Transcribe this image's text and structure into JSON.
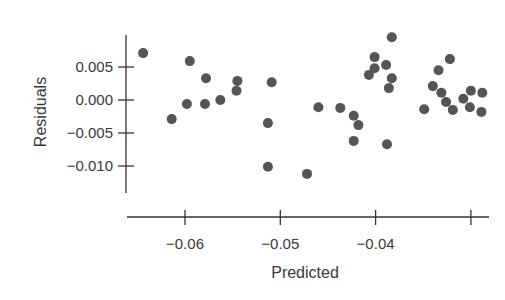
{
  "chart_data": {
    "type": "scatter",
    "title": "",
    "xlabel": "Predicted",
    "ylabel": "Residuals",
    "xlim": [
      -0.066,
      -0.0275
    ],
    "ylim": [
      -0.014,
      0.0097
    ],
    "grid": false,
    "legend": null,
    "x_ticks": [
      -0.06,
      -0.05,
      -0.04,
      -0.03
    ],
    "x_tick_labels": [
      "−0.06",
      "−0.05",
      "−0.04",
      ""
    ],
    "y_ticks": [
      0.005,
      0.0,
      -0.005,
      -0.01
    ],
    "y_tick_labels": [
      "0.005",
      "0.000",
      "−0.005",
      "−0.010"
    ],
    "point_color": "#555555",
    "points": [
      {
        "x": -0.0644,
        "y": 0.0071
      },
      {
        "x": -0.0595,
        "y": 0.0059
      },
      {
        "x": -0.0578,
        "y": 0.0033
      },
      {
        "x": -0.0545,
        "y": 0.0029
      },
      {
        "x": -0.0546,
        "y": 0.0014
      },
      {
        "x": -0.0563,
        "y": 0.0
      },
      {
        "x": -0.0579,
        "y": -0.0006
      },
      {
        "x": -0.0598,
        "y": -0.0006
      },
      {
        "x": -0.0614,
        "y": -0.0029
      },
      {
        "x": -0.0509,
        "y": 0.0027
      },
      {
        "x": -0.0513,
        "y": -0.0035
      },
      {
        "x": -0.0513,
        "y": -0.0101
      },
      {
        "x": -0.0472,
        "y": -0.0112
      },
      {
        "x": -0.046,
        "y": -0.0011
      },
      {
        "x": -0.0437,
        "y": -0.0012
      },
      {
        "x": -0.0423,
        "y": -0.0024
      },
      {
        "x": -0.0418,
        "y": -0.0038
      },
      {
        "x": -0.0423,
        "y": -0.0062
      },
      {
        "x": -0.0388,
        "y": -0.0067
      },
      {
        "x": -0.0383,
        "y": 0.0095
      },
      {
        "x": -0.0401,
        "y": 0.0065
      },
      {
        "x": -0.0389,
        "y": 0.0053
      },
      {
        "x": -0.0401,
        "y": 0.0048
      },
      {
        "x": -0.0407,
        "y": 0.0038
      },
      {
        "x": -0.0383,
        "y": 0.0033
      },
      {
        "x": -0.0386,
        "y": 0.0018
      },
      {
        "x": -0.0349,
        "y": -0.0014
      },
      {
        "x": -0.034,
        "y": 0.0021
      },
      {
        "x": -0.0334,
        "y": 0.0045
      },
      {
        "x": -0.0322,
        "y": 0.0062
      },
      {
        "x": -0.0331,
        "y": 0.0011
      },
      {
        "x": -0.0326,
        "y": -0.0003
      },
      {
        "x": -0.0319,
        "y": -0.0015
      },
      {
        "x": -0.0308,
        "y": 0.0002
      },
      {
        "x": -0.03,
        "y": 0.0014
      },
      {
        "x": -0.0301,
        "y": -0.0011
      },
      {
        "x": -0.0288,
        "y": 0.0011
      },
      {
        "x": -0.0289,
        "y": -0.0018
      }
    ]
  }
}
